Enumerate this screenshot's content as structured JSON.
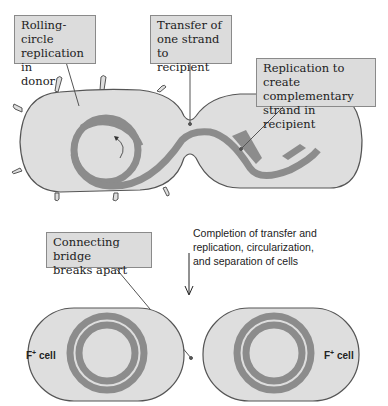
{
  "callouts": {
    "rolling_circle": "Rolling-circle\nreplication in\ndonor",
    "transfer": "Transfer of\none strand to\nrecipient",
    "replication": "Replication to create\ncomplementary\nstrand in recipient",
    "bridge": "Connecting bridge\nbreaks apart"
  },
  "step_note": "Completion of transfer and\nreplication, circularization,\nand separation of cells",
  "cells": {
    "left": {
      "label": "F",
      "superscript": "+",
      "suffix": " cell"
    },
    "right": {
      "label": "F",
      "superscript": "+",
      "suffix": " cell"
    }
  },
  "colors": {
    "cell_fill": "#dedede",
    "cell_stroke": "#555555",
    "dna": "#8c8c8c",
    "callout_fill": "#dcdcdc"
  }
}
